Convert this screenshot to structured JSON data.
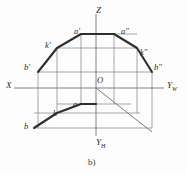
{
  "figure": {
    "caption": "b)",
    "title_text": "",
    "colors": {
      "background": "#fdfdfd",
      "thin_line": "#8e8e8e",
      "thick_line": "#2e2e2e",
      "label_text": "#2b2b2b"
    }
  },
  "axes": [
    {
      "name": "x-axis",
      "label": "X",
      "label_x": 6,
      "label_y": 81
    },
    {
      "name": "z-axis",
      "label": "Z",
      "label_x": 96,
      "label_y": 6
    },
    {
      "name": "yw-axis",
      "label": "Y",
      "sub": "W",
      "label_x": 167,
      "label_y": 81
    },
    {
      "name": "yh-axis",
      "label": "Y",
      "sub": "H",
      "label_x": 96,
      "label_y": 138
    }
  ],
  "origin": {
    "label": "O",
    "label_x": 97,
    "label_y": 76
  },
  "points": [
    {
      "name": "a-prime",
      "label": "a'",
      "label_x": 74,
      "label_y": 27
    },
    {
      "name": "a-double-prime",
      "label": "a\"",
      "label_x": 121,
      "label_y": 27
    },
    {
      "name": "k-prime",
      "label": "k'",
      "label_x": 45,
      "label_y": 41
    },
    {
      "name": "k-double-prime",
      "label": "k\"",
      "label_x": 140,
      "label_y": 48
    },
    {
      "name": "b-prime",
      "label": "b'",
      "label_x": 24,
      "label_y": 63
    },
    {
      "name": "b-double-prime",
      "label": "b\"",
      "label_x": 154,
      "label_y": 63
    },
    {
      "name": "a-plan",
      "label": "a",
      "label_x": 73,
      "label_y": 100
    },
    {
      "name": "k-plan",
      "label": "k",
      "label_x": 53,
      "label_y": 109
    },
    {
      "name": "b-plan",
      "label": "b",
      "label_x": 24,
      "label_y": 122
    }
  ],
  "geometry": {
    "origin_point": [
      96,
      88
    ],
    "x_axis": [
      [
        14,
        88
      ],
      [
        96,
        88
      ]
    ],
    "yw_axis": [
      [
        96,
        88
      ],
      [
        164,
        88
      ]
    ],
    "z_axis": [
      [
        96,
        14
      ],
      [
        96,
        88
      ]
    ],
    "yh_axis": [
      [
        96,
        88
      ],
      [
        96,
        136
      ]
    ],
    "bisector_45": [
      [
        96,
        88
      ],
      [
        152,
        132
      ]
    ],
    "front_view_outline": [
      [
        38,
        72
      ],
      [
        57,
        48
      ],
      [
        81,
        34
      ],
      [
        114,
        34
      ],
      [
        137,
        48
      ],
      [
        152,
        72
      ]
    ],
    "side_view_outline": [
      [
        114,
        34
      ],
      [
        137,
        48
      ],
      [
        152,
        72
      ]
    ],
    "top_view_outline": [
      [
        34,
        128
      ],
      [
        81,
        104
      ],
      [
        96,
        104
      ]
    ],
    "thin_horizontals": [
      {
        "y": 34,
        "x1": 81,
        "x2": 137
      },
      {
        "y": 48,
        "x1": 57,
        "x2": 137
      },
      {
        "y": 72,
        "x1": 38,
        "x2": 152
      },
      {
        "y": 104,
        "x1": 57,
        "x2": 131
      },
      {
        "y": 113,
        "x1": 34,
        "x2": 140
      },
      {
        "y": 128,
        "x1": 34,
        "x2": 152
      }
    ],
    "thin_verticals": [
      {
        "x": 38,
        "y1": 72,
        "y2": 128
      },
      {
        "x": 57,
        "y1": 48,
        "y2": 113
      },
      {
        "x": 81,
        "y1": 34,
        "y2": 104
      },
      {
        "x": 114,
        "y1": 34,
        "y2": 88
      },
      {
        "x": 137,
        "y1": 48,
        "y2": 88
      },
      {
        "x": 152,
        "y1": 72,
        "y2": 128
      }
    ]
  }
}
